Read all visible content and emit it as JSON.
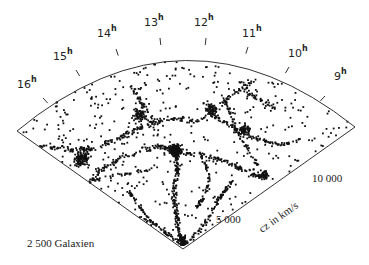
{
  "figure": {
    "caption": "2 500 Galaxien",
    "axis_label": "cz in km/s",
    "radial_ticks": [
      {
        "label": "5 000",
        "x": 216,
        "y": 223
      },
      {
        "label": "10 000",
        "x": 312,
        "y": 182
      }
    ],
    "hour_labels": [
      {
        "h": "16",
        "x": 17,
        "y": 88
      },
      {
        "h": "15",
        "x": 53,
        "y": 60
      },
      {
        "h": "14",
        "x": 97,
        "y": 37
      },
      {
        "h": "13",
        "x": 144,
        "y": 26
      },
      {
        "h": "12",
        "x": 194,
        "y": 26
      },
      {
        "h": "11",
        "x": 242,
        "y": 37
      },
      {
        "h": "10",
        "x": 288,
        "y": 57
      },
      {
        "h": "9",
        "x": 334,
        "y": 80
      }
    ],
    "hour_unit": "h",
    "galaxy_count": 2500
  },
  "geometry": {
    "apex": [
      183,
      249
    ],
    "left_corner": [
      17,
      131
    ],
    "right_corner": [
      355,
      127
    ],
    "arc_control": [
      185,
      -8
    ],
    "tick_marks": [
      [
        43,
        98
      ],
      [
        76,
        70
      ],
      [
        116,
        49
      ],
      [
        160,
        38
      ],
      [
        206,
        38
      ],
      [
        248,
        47
      ],
      [
        289,
        67
      ],
      [
        325,
        96
      ]
    ],
    "dot_color": "#111111"
  },
  "structures": {
    "filaments": [
      {
        "pts": [
          [
            183,
            247
          ],
          [
            178,
            228
          ],
          [
            176,
            210
          ],
          [
            174,
            190
          ],
          [
            178,
            170
          ],
          [
            175,
            152
          ]
        ],
        "n": 170,
        "w": 4
      },
      {
        "pts": [
          [
            175,
            152
          ],
          [
            160,
            146
          ],
          [
            140,
            150
          ],
          [
            118,
            160
          ],
          [
            100,
            170
          ],
          [
            90,
            182
          ]
        ],
        "n": 110,
        "w": 4
      },
      {
        "pts": [
          [
            175,
            152
          ],
          [
            200,
            155
          ],
          [
            222,
            160
          ],
          [
            245,
            170
          ],
          [
            262,
            178
          ]
        ],
        "n": 110,
        "w": 4
      },
      {
        "pts": [
          [
            183,
            245
          ],
          [
            200,
            230
          ],
          [
            212,
            212
          ],
          [
            222,
            195
          ],
          [
            232,
            182
          ]
        ],
        "n": 90,
        "w": 3
      },
      {
        "pts": [
          [
            183,
            245
          ],
          [
            165,
            232
          ],
          [
            150,
            220
          ],
          [
            138,
            205
          ],
          [
            128,
            190
          ]
        ],
        "n": 80,
        "w": 3
      },
      {
        "pts": [
          [
            150,
            220
          ],
          [
            125,
            215
          ],
          [
            105,
            210
          ],
          [
            88,
            205
          ]
        ],
        "n": 45,
        "w": 3
      },
      {
        "pts": [
          [
            32,
            145
          ],
          [
            55,
            148
          ],
          [
            75,
            150
          ],
          [
            95,
            148
          ],
          [
            115,
            140
          ],
          [
            135,
            130
          ],
          [
            155,
            122
          ],
          [
            175,
            118
          ],
          [
            195,
            122
          ],
          [
            210,
            115
          ],
          [
            225,
            100
          ],
          [
            240,
            90
          ],
          [
            255,
            80
          ]
        ],
        "n": 220,
        "w": 4
      },
      {
        "pts": [
          [
            210,
            115
          ],
          [
            230,
            125
          ],
          [
            245,
            135
          ],
          [
            262,
            140
          ],
          [
            280,
            145
          ],
          [
            300,
            140
          ]
        ],
        "n": 90,
        "w": 3
      },
      {
        "pts": [
          [
            225,
            100
          ],
          [
            232,
            118
          ],
          [
            238,
            135
          ],
          [
            248,
            150
          ],
          [
            258,
            165
          ]
        ],
        "n": 70,
        "w": 3
      },
      {
        "pts": [
          [
            90,
            182
          ],
          [
            110,
            176
          ],
          [
            135,
            172
          ],
          [
            160,
            168
          ]
        ],
        "n": 40,
        "w": 3
      },
      {
        "pts": [
          [
            200,
            155
          ],
          [
            210,
            175
          ],
          [
            205,
            195
          ],
          [
            195,
            210
          ]
        ],
        "n": 60,
        "w": 3
      },
      {
        "pts": [
          [
            130,
            85
          ],
          [
            140,
            100
          ],
          [
            150,
            115
          ],
          [
            160,
            125
          ]
        ],
        "n": 40,
        "w": 4
      },
      {
        "pts": [
          [
            240,
            80
          ],
          [
            250,
            95
          ],
          [
            262,
            100
          ],
          [
            275,
            108
          ]
        ],
        "n": 40,
        "w": 4
      }
    ],
    "clusters": [
      {
        "c": [
          176,
          150
        ],
        "r": 10,
        "n": 200
      },
      {
        "c": [
          82,
          158
        ],
        "r": 12,
        "n": 140
      },
      {
        "c": [
          140,
          115
        ],
        "r": 12,
        "n": 70
      },
      {
        "c": [
          212,
          110
        ],
        "r": 10,
        "n": 70
      },
      {
        "c": [
          60,
          168
        ],
        "r": 8,
        "n": 50
      },
      {
        "c": [
          245,
          130
        ],
        "r": 10,
        "n": 60
      },
      {
        "c": [
          183,
          240
        ],
        "r": 7,
        "n": 60
      },
      {
        "c": [
          265,
          175
        ],
        "r": 8,
        "n": 40
      }
    ],
    "field_count": 420,
    "seed": 12345
  }
}
